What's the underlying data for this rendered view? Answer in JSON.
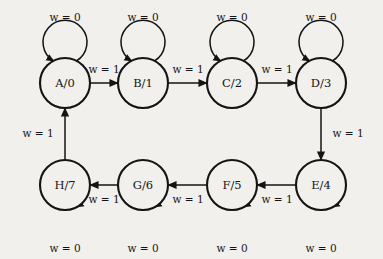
{
  "diagram": {
    "type": "finite-state-machine",
    "background_color": "#f2f0ec",
    "ink_color": "#141414",
    "node_radius": 25,
    "states": [
      {
        "id": "A",
        "label": "A/0",
        "cx": 65,
        "cy": 83,
        "row": "top",
        "self_loop_label": "w = 0",
        "self_loop_side": "top",
        "self_loop_label_x": 65,
        "self_loop_label_y": 18
      },
      {
        "id": "B",
        "label": "B/1",
        "cx": 143,
        "cy": 83,
        "row": "top",
        "self_loop_label": "w = 0",
        "self_loop_side": "top",
        "self_loop_label_x": 143,
        "self_loop_label_y": 18
      },
      {
        "id": "C",
        "label": "C/2",
        "cx": 232,
        "cy": 83,
        "row": "top",
        "self_loop_label": "w = 0",
        "self_loop_side": "top",
        "self_loop_label_x": 232,
        "self_loop_label_y": 18
      },
      {
        "id": "D",
        "label": "D/3",
        "cx": 321,
        "cy": 83,
        "row": "top",
        "self_loop_label": "w = 0",
        "self_loop_side": "top",
        "self_loop_label_x": 321,
        "self_loop_label_y": 18
      },
      {
        "id": "E",
        "label": "E/4",
        "cx": 321,
        "cy": 185,
        "row": "bottom",
        "self_loop_label": "w = 0",
        "self_loop_side": "bottom",
        "self_loop_label_x": 321,
        "self_loop_label_y": 249
      },
      {
        "id": "F",
        "label": "F/5",
        "cx": 232,
        "cy": 185,
        "row": "bottom",
        "self_loop_label": "w = 0",
        "self_loop_side": "bottom",
        "self_loop_label_x": 232,
        "self_loop_label_y": 249
      },
      {
        "id": "G",
        "label": "G/6",
        "cx": 143,
        "cy": 185,
        "row": "bottom",
        "self_loop_label": "w = 0",
        "self_loop_side": "bottom",
        "self_loop_label_x": 143,
        "self_loop_label_y": 249
      },
      {
        "id": "H",
        "label": "H/7",
        "cx": 65,
        "cy": 185,
        "row": "bottom",
        "self_loop_label": "w = 0",
        "self_loop_side": "bottom",
        "self_loop_label_x": 65,
        "self_loop_label_y": 249
      }
    ],
    "transitions": [
      {
        "from": "A",
        "to": "B",
        "label": "w = 1",
        "direction": "right",
        "label_x": 104,
        "label_y": 70
      },
      {
        "from": "B",
        "to": "C",
        "label": "w = 1",
        "direction": "right",
        "label_x": 188,
        "label_y": 70
      },
      {
        "from": "C",
        "to": "D",
        "label": "w = 1",
        "direction": "right",
        "label_x": 277,
        "label_y": 70
      },
      {
        "from": "D",
        "to": "E",
        "label": "w = 1",
        "direction": "down",
        "label_x": 348,
        "label_y": 134
      },
      {
        "from": "E",
        "to": "F",
        "label": "w = 1",
        "direction": "left",
        "label_x": 277,
        "label_y": 200
      },
      {
        "from": "F",
        "to": "G",
        "label": "w = 1",
        "direction": "left",
        "label_x": 188,
        "label_y": 200
      },
      {
        "from": "G",
        "to": "H",
        "label": "w = 1",
        "direction": "left",
        "label_x": 104,
        "label_y": 200
      },
      {
        "from": "H",
        "to": "A",
        "label": "w = 1",
        "direction": "up",
        "label_x": 38,
        "label_y": 134
      }
    ],
    "input_variable": "w",
    "self_loop_input_value": "0",
    "advance_input_value": "1"
  }
}
